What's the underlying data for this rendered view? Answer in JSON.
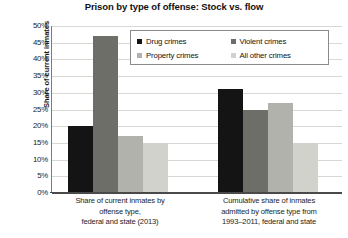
{
  "chart_data": {
    "type": "bar",
    "title": "Prison by type of offense: Stock vs. flow",
    "xlabel": "",
    "ylabel": "Share of current inmates",
    "ylim": [
      0,
      50
    ],
    "ytick_labels": [
      "50%",
      "45%",
      "40%",
      "35%",
      "30%",
      "25%",
      "20%",
      "15%",
      "10%",
      "5%",
      "0%"
    ],
    "ytick_values": [
      50,
      45,
      40,
      35,
      30,
      25,
      20,
      15,
      10,
      5,
      0
    ],
    "grid": true,
    "legend_position": "upper-center",
    "categories": [
      "Share of current inmates by offense type, federal and state (2013)",
      "Cumulative share of inmates admitted by offense type from 1993–2011, federal and state"
    ],
    "category_label_lines": [
      [
        "Share of current inmates by",
        "offense type,",
        "federal and state (2013)"
      ],
      [
        "Cumulative share of inmates",
        "admitted by offense type from",
        "1993–2011, federal and state"
      ]
    ],
    "series": [
      {
        "name": "Drug crimes",
        "color": "#141414",
        "values": [
          20,
          31
        ]
      },
      {
        "name": "Violent crimes",
        "color": "#6e6e68",
        "values": [
          47,
          25
        ]
      },
      {
        "name": "Property crimes",
        "color": "#b2b2ad",
        "values": [
          17,
          27
        ]
      },
      {
        "name": "All other crimes",
        "color": "#d2d2cd",
        "values": [
          15,
          15
        ]
      }
    ]
  },
  "legend": {
    "items": [
      {
        "label": "Drug crimes",
        "color": "#141414"
      },
      {
        "label": "Violent crimes",
        "color": "#6e6e68"
      },
      {
        "label": "Property crimes",
        "color": "#b2b2ad"
      },
      {
        "label": "All other crimes",
        "color": "#d2d2cd"
      }
    ]
  }
}
